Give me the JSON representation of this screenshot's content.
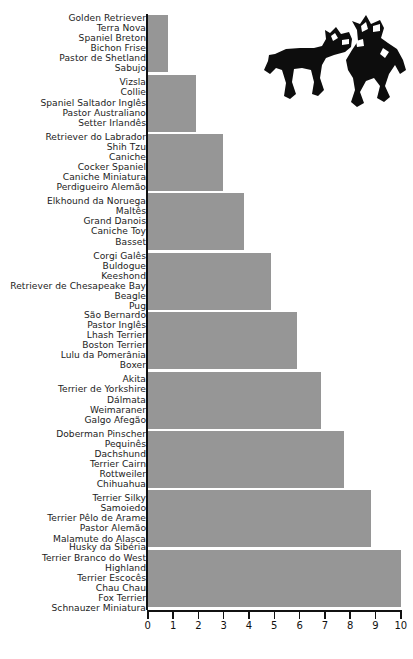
{
  "chart_data": {
    "type": "bar",
    "orientation": "horizontal",
    "title": "",
    "subtitle": "",
    "xlabel": "",
    "ylabel": "",
    "xlim": [
      0,
      10
    ],
    "grid": false,
    "legend": null,
    "bar_color": "#969696",
    "axis_color": "#111111",
    "xticks": [
      "0",
      "1",
      "2",
      "3",
      "4",
      "5",
      "6",
      "7",
      "8",
      "9",
      "10"
    ],
    "xtick_values": [
      0,
      1,
      2,
      3,
      4,
      5,
      6,
      7,
      8,
      9,
      10
    ],
    "categories": [
      "Golden Retriever / Terra Nova / Spaniel Breton / Bichon Frise / Pastor de Shetland / Sabujo",
      "Vizsla / Collie / Spaniel Saltador Inglês / Pastor Australiano / Setter Irlandês",
      "Retriever do Labrador / Shih Tzu / Caniche / Cocker Spaniel / Caniche Miniatura / Perdigueiro Alemão",
      "Elkhound da Noruega / Maltês / Grand Danois / Caniche Toy / Basset",
      "Corgi Galês / Buldogue / Keeshond / Retriever de Chesapeake Bay / Beagle / Pug",
      "São Bernardo / Pastor Inglês / Lhash Terrier / Boston Terrier / Lulu da Pomerânia / Boxer",
      "Akita / Terrier de Yorkshire / Dálmata / Weimaraner / Galgo Afegão",
      "Doberman Pinscher / Pequinês / Dachshund / Terrier Cairn / Rottweiler / Chihuahua",
      "Terrier Silky / Samoiedo / Terrier Pêlo de Arame / Pastor Alemão / Malamute do Alasca",
      "Husky da Sibéria / Terrier Branco do West / Highland / Terrier Escocês / Chau Chau / Fox Terrier / Schnauzer Miniatura"
    ],
    "values": [
      0.8,
      1.9,
      2.95,
      3.8,
      4.85,
      5.9,
      6.85,
      7.75,
      8.8,
      10.0
    ]
  },
  "rows": [
    {
      "value": 0.8,
      "labels": [
        "Golden Retriever",
        "Terra Nova",
        "Spaniel Breton",
        "Bichon Frise",
        "Pastor de Shetland",
        "Sabujo"
      ]
    },
    {
      "value": 1.9,
      "labels": [
        "Vizsla",
        "Collie",
        "Spaniel Saltador Inglês",
        "Pastor Australiano",
        "Setter Irlandês"
      ]
    },
    {
      "value": 2.95,
      "labels": [
        "Retriever do Labrador",
        "Shih Tzu",
        "Caniche",
        "Cocker Spaniel",
        "Caniche Miniatura",
        "Perdigueiro Alemão"
      ]
    },
    {
      "value": 3.8,
      "labels": [
        "Elkhound da Noruega",
        "Maltês",
        "Grand Danois",
        "Caniche Toy",
        "Basset"
      ]
    },
    {
      "value": 4.85,
      "labels": [
        "Corgi Galês",
        "Buldogue",
        "Keeshond",
        "Retriever de Chesapeake Bay",
        "Beagle",
        "Pug"
      ]
    },
    {
      "value": 5.9,
      "labels": [
        "São Bernardo",
        "Pastor Inglês",
        "Lhash Terrier",
        "Boston Terrier",
        "Lulu da Pomerânia",
        "Boxer"
      ]
    },
    {
      "value": 6.85,
      "labels": [
        "Akita",
        "Terrier de Yorkshire",
        "Dálmata",
        "Weimaraner",
        "Galgo Afegão"
      ]
    },
    {
      "value": 7.75,
      "labels": [
        "Doberman Pinscher",
        "Pequinês",
        "Dachshund",
        "Terrier Cairn",
        "Rottweiler",
        "Chihuahua"
      ]
    },
    {
      "value": 8.8,
      "labels": [
        "Terrier Silky",
        "Samoiedo",
        "Terrier Pêlo de Arame",
        "Pastor Alemão",
        "Malamute do Alasca"
      ]
    },
    {
      "value": 10.0,
      "labels": [
        "Husky da Sibéria",
        "Terrier Branco do West",
        "Highland",
        "Terrier Escocês",
        "Chau Chau",
        "Fox Terrier",
        "Schnauzer Miniatura"
      ]
    }
  ],
  "decoration": {
    "icon_name": "two-dogs-playing-silhouette",
    "icon_color": "#0d0d0d"
  }
}
